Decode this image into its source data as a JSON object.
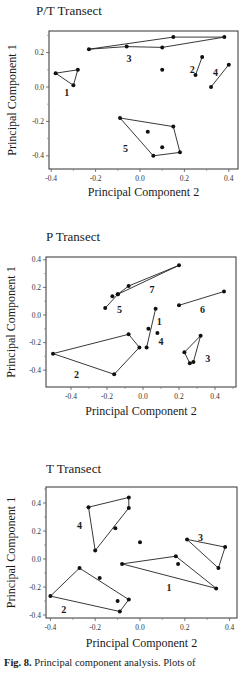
{
  "figure": {
    "caption_label": "Fig. 8.",
    "caption_text": "Principal component analysis. Plots of"
  },
  "chart_data": [
    {
      "type": "scatter",
      "title": "P/T  Transect",
      "xlabel": "Principal Component  2",
      "ylabel": "Principal Component  1",
      "xlim": [
        -0.42,
        0.43
      ],
      "ylim": [
        -0.47,
        0.33
      ],
      "xticks": [
        -0.4,
        -0.2,
        0.0,
        0.2,
        0.4
      ],
      "xtick_labels": [
        "-0.4",
        "-0.2",
        "0.0",
        "0.2",
        "0.4"
      ],
      "yticks": [
        -0.4,
        -0.2,
        0.0,
        0.2
      ],
      "ytick_labels": [
        "-0.4",
        "-0.2",
        "0.0",
        "0.2"
      ],
      "grid": false,
      "groups": [
        {
          "label": "1",
          "label_pos": [
            -0.33,
            -0.03
          ],
          "hull": [
            [
              -0.38,
              0.08
            ],
            [
              -0.28,
              0.1
            ],
            [
              -0.3,
              0.01
            ]
          ],
          "inner": []
        },
        {
          "label": "3",
          "label_pos": [
            -0.05,
            0.17
          ],
          "hull": [
            [
              -0.23,
              0.22
            ],
            [
              0.15,
              0.29
            ],
            [
              0.38,
              0.29
            ],
            [
              0.1,
              0.23
            ],
            [
              -0.06,
              0.235
            ]
          ],
          "inner": []
        },
        {
          "label": "2",
          "label_pos": [
            0.235,
            0.105
          ],
          "hull": [
            [
              0.25,
              0.07
            ],
            [
              0.28,
              0.175
            ]
          ],
          "inner": []
        },
        {
          "label": "4",
          "label_pos": [
            0.34,
            0.085
          ],
          "hull": [
            [
              0.32,
              0.0
            ],
            [
              0.4,
              0.13
            ]
          ],
          "inner": []
        },
        {
          "label": "5",
          "label_pos": [
            -0.065,
            -0.355
          ],
          "hull": [
            [
              -0.09,
              -0.18
            ],
            [
              0.15,
              -0.23
            ],
            [
              0.18,
              -0.38
            ],
            [
              0.06,
              -0.4
            ]
          ],
          "inner": [
            [
              0.035,
              -0.26
            ],
            [
              0.1,
              -0.35
            ]
          ]
        }
      ],
      "isolated_points": [
        [
          0.1,
          0.1
        ]
      ]
    },
    {
      "type": "scatter",
      "title": "P  Transect",
      "xlabel": "Principal Component  2",
      "ylabel": "Principal Component  1",
      "xlim": [
        -0.54,
        0.52
      ],
      "ylim": [
        -0.52,
        0.42
      ],
      "xticks": [
        -0.4,
        -0.2,
        0.0,
        0.2,
        0.4
      ],
      "xtick_labels": [
        "-0.4",
        "-0.2",
        "0.0",
        "0.2",
        "0.4"
      ],
      "yticks": [
        -0.4,
        -0.2,
        0.0,
        0.2,
        0.4
      ],
      "ytick_labels": [
        "-0.4",
        "-0.2",
        "0.0",
        "0.2",
        "0.4"
      ],
      "grid": false,
      "groups": [
        {
          "label": "7",
          "label_pos": [
            0.05,
            0.19
          ],
          "hull": [
            [
              -0.14,
              0.15
            ],
            [
              -0.08,
              0.21
            ],
            [
              0.2,
              0.36
            ]
          ],
          "inner": []
        },
        {
          "label": "5",
          "label_pos": [
            -0.13,
            0.04
          ],
          "hull": [
            [
              -0.21,
              0.05
            ],
            [
              -0.14,
              0.15
            ]
          ],
          "inner": [
            [
              -0.17,
              0.135
            ]
          ]
        },
        {
          "label": "6",
          "label_pos": [
            0.33,
            0.04
          ],
          "hull": [
            [
              0.2,
              0.07
            ],
            [
              0.45,
              0.17
            ]
          ],
          "inner": []
        },
        {
          "label": "1",
          "label_pos": [
            0.09,
            -0.04
          ],
          "hull": [
            [
              0.07,
              0.045
            ],
            [
              0.02,
              -0.235
            ]
          ],
          "inner": []
        },
        {
          "label": "4",
          "label_pos": [
            0.1,
            -0.19
          ],
          "hull": [
            [
              0.08,
              -0.13
            ]
          ],
          "inner": []
        },
        {
          "label": "2",
          "label_pos": [
            -0.37,
            -0.43
          ],
          "hull": [
            [
              -0.5,
              -0.28
            ],
            [
              -0.08,
              -0.14
            ],
            [
              -0.02,
              -0.235
            ],
            [
              -0.16,
              -0.43
            ]
          ],
          "inner": []
        },
        {
          "label": "3",
          "label_pos": [
            0.36,
            -0.31
          ],
          "hull": [
            [
              0.32,
              -0.15
            ],
            [
              0.28,
              -0.34
            ],
            [
              0.26,
              -0.35
            ],
            [
              0.23,
              -0.27
            ]
          ],
          "inner": []
        }
      ],
      "isolated_points": [
        [
          0.03,
          -0.1
        ]
      ]
    },
    {
      "type": "scatter",
      "title": "T  Transect",
      "xlabel": "Principal Component  2",
      "ylabel": "Principal Component  1",
      "xlim": [
        -0.42,
        0.43
      ],
      "ylim": [
        -0.42,
        0.5
      ],
      "xticks": [
        -0.4,
        -0.2,
        0.0,
        0.2,
        0.4
      ],
      "xtick_labels": [
        "-0.4",
        "-0.2",
        "0.0",
        "0.2",
        "0.4"
      ],
      "yticks": [
        -0.4,
        -0.2,
        0.0,
        0.2,
        0.4
      ],
      "ytick_labels": [
        "-0.4",
        "-0.2",
        "0.0",
        "0.2",
        "0.4"
      ],
      "grid": false,
      "groups": [
        {
          "label": "4",
          "label_pos": [
            -0.27,
            0.24
          ],
          "hull": [
            [
              -0.23,
              0.37
            ],
            [
              -0.05,
              0.44
            ],
            [
              -0.05,
              0.365
            ],
            [
              -0.2,
              0.06
            ]
          ],
          "inner": [
            [
              -0.11,
              0.22
            ]
          ]
        },
        {
          "label": "3",
          "label_pos": [
            0.27,
            0.155
          ],
          "hull": [
            [
              0.21,
              0.14
            ],
            [
              0.38,
              0.085
            ],
            [
              0.35,
              -0.065
            ]
          ],
          "inner": []
        },
        {
          "label": "1",
          "label_pos": [
            0.13,
            -0.2
          ],
          "hull": [
            [
              -0.08,
              -0.035
            ],
            [
              0.16,
              0.02
            ],
            [
              0.34,
              -0.21
            ]
          ],
          "inner": [
            [
              0.17,
              -0.035
            ]
          ]
        },
        {
          "label": "2",
          "label_pos": [
            -0.34,
            -0.36
          ],
          "hull": [
            [
              -0.4,
              -0.265
            ],
            [
              -0.27,
              -0.065
            ],
            [
              -0.05,
              -0.29
            ],
            [
              -0.09,
              -0.375
            ]
          ],
          "inner": [
            [
              -0.18,
              -0.135
            ],
            [
              -0.1,
              -0.3
            ]
          ]
        }
      ],
      "isolated_points": [
        [
          0.0,
          0.12
        ]
      ]
    }
  ],
  "layout": [
    {
      "title_x": 36,
      "title_y": 2,
      "frame": [
        49,
        31,
        238,
        169
      ],
      "x0": 140,
      "xs": 222,
      "y0": 87,
      "ys": 172,
      "xlabel_y": 185,
      "ylabel_x": 12
    },
    {
      "title_x": 46,
      "title_y": 228,
      "frame": [
        46,
        257,
        236,
        387
      ],
      "x0": 143,
      "xs": 180,
      "y0": 315,
      "ys": 138,
      "xlabel_y": 404,
      "ylabel_x": 11
    },
    {
      "title_x": 46,
      "title_y": 460,
      "frame": [
        46,
        487,
        237,
        618
      ],
      "x0": 140,
      "xs": 224,
      "y0": 559,
      "ys": 140,
      "xlabel_y": 636,
      "ylabel_x": 11
    }
  ]
}
